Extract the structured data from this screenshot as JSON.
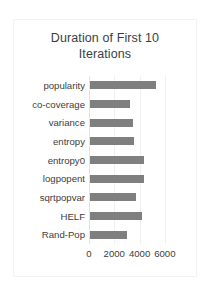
{
  "chart_data": {
    "type": "bar",
    "orientation": "horizontal",
    "title": "Duration of First 10 Iterations",
    "title_line1": "Duration of First 10",
    "title_line2": "Iterations",
    "xlabel": "",
    "ylabel": "",
    "categories": [
      "popularity",
      "co-coverage",
      "variance",
      "entropy",
      "entropy0",
      "logpopent",
      "sqrtpopvar",
      "HELF",
      "Rand-Pop"
    ],
    "values": [
      5200,
      3200,
      3400,
      3450,
      4300,
      4250,
      3600,
      4150,
      2900
    ],
    "xlim": [
      0,
      6800
    ],
    "xticks": [
      0,
      2000,
      4000,
      6000
    ],
    "xtick_labels": [
      "0",
      "2000",
      "4000",
      "6000"
    ],
    "grid": true,
    "legend": false,
    "bar_color": "#7f7f7f",
    "plot_background": "#ffffff",
    "text_color": "#3d3d3d"
  }
}
